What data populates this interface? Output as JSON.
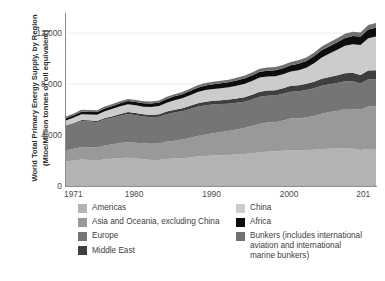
{
  "chart_data": {
    "type": "area",
    "title": "",
    "subtitle": "",
    "ylabel_line1": "World Total Primary Energy Supply, by Region",
    "ylabel_line2": "(Mtoe/Million tonnes of oil equivalent)",
    "xlabel": "",
    "stacked": true,
    "grid": true,
    "grid_axis": "y",
    "legend_position": "bottom",
    "ylim": [
      0,
      13500
    ],
    "yticks": [
      0,
      4000,
      8000,
      12000
    ],
    "ytick_labels": [
      "0",
      "4,000",
      "8,000",
      "12,000"
    ],
    "xlim": [
      1971,
      2011
    ],
    "xticks": [
      1971,
      1980,
      1990,
      2000,
      2010
    ],
    "xtick_labels": [
      "1971",
      "1980",
      "1990",
      "2000",
      "201"
    ],
    "x": [
      1971,
      1972,
      1973,
      1974,
      1975,
      1976,
      1977,
      1978,
      1979,
      1980,
      1981,
      1982,
      1983,
      1984,
      1985,
      1986,
      1987,
      1988,
      1989,
      1990,
      1991,
      1992,
      1993,
      1994,
      1995,
      1996,
      1997,
      1998,
      1999,
      2000,
      2001,
      2002,
      2003,
      2004,
      2005,
      2006,
      2007,
      2008,
      2009,
      2010,
      2011
    ],
    "series": [
      {
        "name": "Americas",
        "color": "#b3b3b3",
        "values": [
          1930,
          2000,
          2080,
          2050,
          2010,
          2090,
          2140,
          2190,
          2210,
          2150,
          2100,
          2050,
          2040,
          2120,
          2150,
          2180,
          2240,
          2320,
          2360,
          2390,
          2400,
          2440,
          2470,
          2520,
          2570,
          2650,
          2690,
          2700,
          2760,
          2830,
          2790,
          2820,
          2840,
          2900,
          2930,
          2940,
          2990,
          2940,
          2830,
          2910,
          2900
        ]
      },
      {
        "name": "Asia and Oceania, excluding China",
        "color": "#999999",
        "values": [
          880,
          930,
          990,
          1000,
          1020,
          1080,
          1130,
          1180,
          1230,
          1240,
          1250,
          1270,
          1300,
          1370,
          1410,
          1460,
          1520,
          1610,
          1690,
          1760,
          1830,
          1900,
          1970,
          2040,
          2140,
          2230,
          2300,
          2290,
          2390,
          2460,
          2500,
          2580,
          2660,
          2780,
          2870,
          2950,
          3060,
          3110,
          3160,
          3330,
          3400
        ]
      },
      {
        "name": "Europe",
        "color": "#757575",
        "values": [
          1880,
          1950,
          2040,
          2020,
          1970,
          2060,
          2080,
          2140,
          2210,
          2170,
          2110,
          2080,
          2090,
          2150,
          2200,
          2230,
          2280,
          2300,
          2290,
          2250,
          2200,
          2120,
          2090,
          2060,
          2080,
          2130,
          2100,
          2110,
          2090,
          2110,
          2140,
          2130,
          2170,
          2190,
          2190,
          2200,
          2170,
          2180,
          2060,
          2130,
          2060
        ]
      },
      {
        "name": "Middle East",
        "color": "#3f3f3f",
        "values": [
          60,
          70,
          80,
          90,
          100,
          110,
          125,
          135,
          150,
          160,
          170,
          180,
          195,
          210,
          225,
          240,
          250,
          265,
          280,
          295,
          310,
          325,
          340,
          355,
          375,
          390,
          405,
          425,
          440,
          460,
          480,
          500,
          520,
          545,
          570,
          595,
          620,
          650,
          670,
          700,
          720
        ]
      },
      {
        "name": "China",
        "color": "#cccccc",
        "values": [
          390,
          420,
          450,
          460,
          500,
          530,
          580,
          610,
          620,
          610,
          600,
          620,
          650,
          690,
          740,
          780,
          830,
          880,
          910,
          920,
          930,
          960,
          1000,
          1040,
          1080,
          1120,
          1100,
          1090,
          1090,
          1120,
          1180,
          1260,
          1450,
          1680,
          1830,
          2000,
          2160,
          2240,
          2350,
          2530,
          2650
        ]
      },
      {
        "name": "Africa",
        "color": "#0d0d0d",
        "values": [
          170,
          180,
          190,
          195,
          205,
          215,
          225,
          235,
          245,
          255,
          265,
          275,
          285,
          295,
          310,
          320,
          330,
          345,
          355,
          370,
          385,
          395,
          405,
          415,
          430,
          445,
          455,
          470,
          480,
          495,
          510,
          525,
          545,
          565,
          585,
          605,
          625,
          650,
          665,
          690,
          705
        ]
      },
      {
        "name": "Bunkers (includes international aviation and international marine bunkers)",
        "color": "#707070",
        "values": [
          140,
          145,
          150,
          148,
          145,
          152,
          158,
          165,
          170,
          168,
          162,
          158,
          156,
          162,
          166,
          172,
          180,
          190,
          196,
          200,
          202,
          208,
          212,
          218,
          226,
          234,
          242,
          246,
          252,
          262,
          264,
          270,
          278,
          292,
          300,
          310,
          322,
          328,
          322,
          340,
          350
        ]
      }
    ]
  },
  "legend": {
    "left_column": [
      {
        "label": "Americas",
        "color": "#b3b3b3"
      },
      {
        "label": "Asia and Oceania, excluding China",
        "color": "#999999"
      },
      {
        "label": "Europe",
        "color": "#757575"
      },
      {
        "label": "Middle East",
        "color": "#3f3f3f"
      }
    ],
    "right_column": [
      {
        "label": "China",
        "color": "#cccccc"
      },
      {
        "label": "Africa",
        "color": "#0d0d0d"
      },
      {
        "label": "Bunkers (includes international\naviation and international\nmarine bunkers)",
        "color": "#707070"
      }
    ]
  },
  "colors": {
    "axis": "#8d8d8d",
    "grid": "#ededed",
    "text": "#3d3d3d",
    "background": "#ffffff"
  }
}
